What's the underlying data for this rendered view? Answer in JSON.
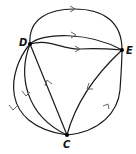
{
  "diagram": {
    "type": "directed-multigraph",
    "vertices": [
      {
        "id": "D",
        "label": "D",
        "x": 30,
        "y": 44
      },
      {
        "id": "E",
        "label": "E",
        "x": 122,
        "y": 50
      },
      {
        "id": "C",
        "label": "C",
        "x": 67,
        "y": 135
      }
    ],
    "edges": [
      {
        "from": "D",
        "to": "E",
        "shape": "top-arc"
      },
      {
        "from": "D",
        "to": "E",
        "shape": "upper-curve"
      },
      {
        "from": "D",
        "to": "E",
        "shape": "lower-curve"
      },
      {
        "from": "C",
        "to": "D",
        "shape": "straight"
      },
      {
        "from": "E",
        "to": "C",
        "shape": "straight"
      },
      {
        "from": "C",
        "to": "E",
        "shape": "right-arc"
      },
      {
        "from": "D",
        "to": "C",
        "shape": "left-inner-arc"
      },
      {
        "from": "D",
        "to": "C",
        "shape": "left-outer-arc"
      }
    ],
    "colors": {
      "stroke": "#1a1a1a",
      "arrow": "#555555",
      "background": "#ffffff"
    }
  }
}
